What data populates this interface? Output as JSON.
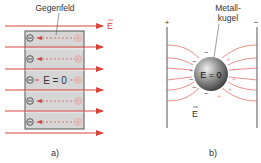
{
  "panel_a": {
    "label": "a)",
    "callout": "Gegenfeld",
    "field_label": "E",
    "inner_text": "E = 0",
    "neg_symbol": "−",
    "pos_symbol": "+",
    "rows": 5,
    "arrows": 6
  },
  "panel_b": {
    "label": "b)",
    "callout_line1": "Metall-",
    "callout_line2": "kugel",
    "field_label": "E",
    "inner_text": "E = 0",
    "plate_left_sign": "+",
    "plate_right_sign": "−"
  },
  "colors": {
    "field_red": "#d9443a",
    "light_red": "#e89a90",
    "box_fill": "#d6d6d6",
    "box_stroke": "#555555",
    "text": "#333333"
  }
}
